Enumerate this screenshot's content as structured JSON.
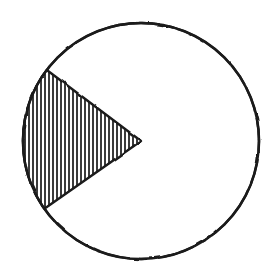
{
  "figure": {
    "title": "Circle with shaded sector",
    "background_color": "#ffffff",
    "stroke_color": "#1a1a1a",
    "fill_color": "#ffffff",
    "hatch_color": "#1a1a1a",
    "canvas": {
      "width": 277,
      "height": 272
    }
  },
  "chart_data": {
    "type": "pie",
    "title": "Circle with shaded sector",
    "xlabel": "",
    "ylabel": "",
    "categories": [
      "shaded sector",
      "unshaded remainder"
    ],
    "values": [
      72,
      288
    ],
    "units": "degrees",
    "fractions": [
      0.2,
      0.8
    ],
    "slice_styles": [
      "vertical-hatch",
      "blank"
    ],
    "legend": false,
    "grid": false,
    "labels_shown": false,
    "geometry": {
      "center_x": 141,
      "center_y": 141,
      "radius": 118,
      "stroke_width": 2.6,
      "sector_start_angle_deg": 143,
      "sector_end_angle_deg": 215,
      "sector_sweep_deg": 72,
      "sector_apex": [
        141,
        141
      ],
      "sector_arc_start_point": [
        47,
        70
      ],
      "sector_arc_end_point": [
        44,
        209
      ],
      "hatch_orientation": "vertical",
      "hatch_spacing_px": 4,
      "hatch_line_width_px": 1.7
    }
  }
}
